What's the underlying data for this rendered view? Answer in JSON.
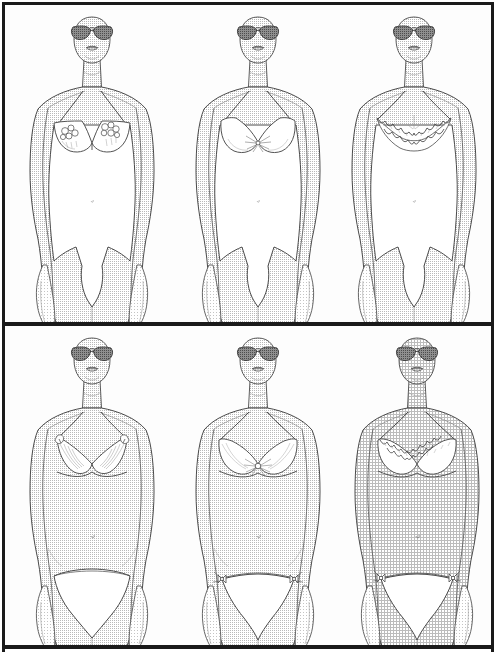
{
  "document": {
    "kind": "illustration-plate",
    "title": "Lingerie Catalog Illustration Plate",
    "style": "halftone line-art fashion croquis",
    "background_color": "#ffffff",
    "frame_color": "#1a1a1a",
    "panel_color": "#fdfdfd",
    "rows": 2,
    "columns": 3,
    "figure_count": 6
  },
  "palette": {
    "ink": "#3a3a3a",
    "ink_dark": "#1a1a1a",
    "skin_halftone": "#c9c9c9",
    "skin_halftone_light": "#d8d8d8",
    "garment_white": "#ffffff",
    "sunglass_lens": "#7a7a7a",
    "sunglass_lens_dark": "#5e5e5e",
    "lip_ink": "#4a4a4a",
    "panel_fill": "#fdfdfd"
  },
  "panels": [
    {
      "id": "panel-top",
      "name": "upper-panel",
      "label": "Bodysuits and teddies",
      "figures": [
        {
          "id": "figure-1",
          "name": "figure-bodysuit-floral",
          "position": "top-left",
          "center_x": 92,
          "garment": "one-piece bodysuit",
          "bodice_detail": "floral appliqué bra cups",
          "straps": "thin spaghetti straps",
          "leg_line": "high-cut french leg",
          "accessory": "aviator sunglasses",
          "skin_texture": "fine halftone dots"
        },
        {
          "id": "figure-2",
          "name": "figure-bodysuit-plunge",
          "position": "top-center",
          "center_x": 258,
          "garment": "one-piece bodysuit",
          "bodice_detail": "deep plunge underwire with center gather",
          "straps": "thin spaghetti straps",
          "leg_line": "high-cut french leg",
          "accessory": "aviator sunglasses",
          "skin_texture": "fine halftone dots"
        },
        {
          "id": "figure-3",
          "name": "figure-bodysuit-scalloped-lace",
          "position": "top-right",
          "center_x": 418,
          "garment": "one-piece bodysuit",
          "bodice_detail": "scalloped lace surplice bodice",
          "straps": "thin spaghetti straps",
          "leg_line": "high-cut french leg",
          "accessory": "aviator sunglasses",
          "skin_texture": "fine halftone dots"
        }
      ]
    },
    {
      "id": "panel-bottom",
      "name": "lower-panel",
      "label": "Bra and panty sets",
      "figures": [
        {
          "id": "figure-4",
          "name": "figure-bra-set-feathered-triangle",
          "position": "bottom-left",
          "center_x": 92,
          "garment": "triangle bra with bikini brief",
          "bodice_detail": "feathered / fringed triangle cups with strap rosettes",
          "straps": "thin spaghetti straps",
          "brief_style": "low-rise bikini brief",
          "accessory": "aviator sunglasses",
          "skin_texture": "fine halftone dots"
        },
        {
          "id": "figure-5",
          "name": "figure-bra-set-underwire-bow",
          "position": "bottom-center",
          "center_x": 258,
          "garment": "underwire bra with string bikini",
          "bodice_detail": "soft gathered cups with center bow",
          "straps": "thin spaghetti straps",
          "brief_style": "string bikini with side bow ties",
          "accessory": "aviator sunglasses",
          "skin_texture": "fine halftone dots"
        },
        {
          "id": "figure-6",
          "name": "figure-bra-set-scalloped-lace",
          "position": "bottom-right",
          "center_x": 420,
          "garment": "scalloped lace bra with string bikini",
          "bodice_detail": "scalloped lace trim across cups",
          "straps": "thin spaghetti straps",
          "brief_style": "string bikini with side bow ties",
          "accessory": "aviator sunglasses",
          "skin_texture": "dense cross-hatch halftone"
        }
      ]
    }
  ],
  "accessory_detail": {
    "sunglasses": {
      "name": "aviator-sunglasses",
      "lens_shape": "teardrop aviator",
      "lens_fill": "halftone shaded",
      "bridge": "double bar"
    },
    "face": {
      "visible_features": [
        "lips",
        "chin",
        "jawline"
      ],
      "hidden_features": [
        "eyes",
        "nose",
        "hair"
      ]
    }
  }
}
